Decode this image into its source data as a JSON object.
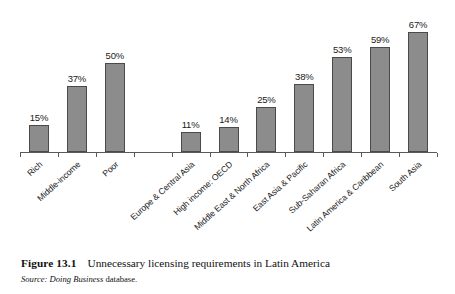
{
  "chart_data": {
    "type": "bar",
    "title": "Unnecessary licensing requirements in Latin America",
    "xlabel": "",
    "ylabel": "",
    "ylim": [
      0,
      75
    ],
    "grid": false,
    "legend": null,
    "value_suffix": "%",
    "categories": [
      "Rich",
      "Middle-income",
      "Poor",
      "",
      "Europe & Central Asia",
      "High income: OECD",
      "Middle East & North Africa",
      "East Asia & Pacific",
      "Sub-Saharan Africa",
      "Latin America & Caribbean",
      "South Asia"
    ],
    "values": [
      15,
      37,
      50,
      null,
      11,
      14,
      25,
      38,
      53,
      59,
      67
    ],
    "value_labels": [
      "15%",
      "37%",
      "50%",
      "",
      "11%",
      "14%",
      "25%",
      "38%",
      "53%",
      "59%",
      "67%"
    ],
    "bar_color": "#8c8c8c",
    "bar_edge_color": "#4a4a4a",
    "axis_color": "#5a5a5a"
  },
  "figure": {
    "number": "Figure 13.1",
    "title": "Unnecessary licensing requirements in Latin America",
    "source_label": "Source:",
    "source_publication": "Doing Business",
    "source_rest": "database."
  }
}
